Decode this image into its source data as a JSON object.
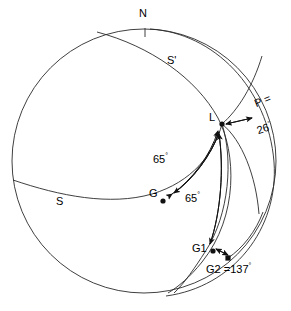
{
  "figure": {
    "type": "stereographic-projection-diagram",
    "stroke_color": "#1a1a1a",
    "background_color": "#ffffff"
  },
  "labels": {
    "north": "N",
    "s_plane": "S",
    "s_prime_plane": "S'",
    "lineation": "L",
    "gamma": "G",
    "gamma_one": "G1",
    "gamma_two_value": "G2 =137",
    "pole_label": "P =",
    "pole_value": "26",
    "angle_upper": "65",
    "angle_lower": "65",
    "degree_symbol": "°"
  },
  "measurements": [
    {
      "name": "angle-G-to-L",
      "value": 65,
      "unit": "degrees",
      "display": "65°"
    },
    {
      "name": "angle-G1-to-L",
      "value": 65,
      "unit": "degrees",
      "display": "65°"
    },
    {
      "name": "pole-P",
      "value": 26,
      "unit": "degrees",
      "display": "26°"
    },
    {
      "name": "G2",
      "value": 137,
      "unit": "degrees",
      "display": "137°"
    }
  ],
  "points": [
    {
      "name": "L",
      "x": 222,
      "y": 124
    },
    {
      "name": "G",
      "x": 163,
      "y": 201
    },
    {
      "name": "G1",
      "x": 213,
      "y": 251
    },
    {
      "name": "G2",
      "x": 228,
      "y": 258
    }
  ]
}
